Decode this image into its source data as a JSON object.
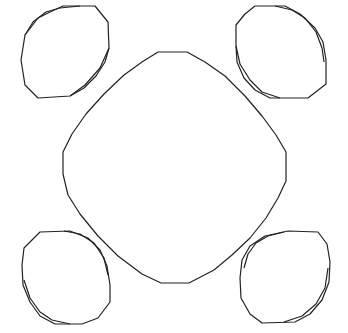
{
  "diagram": {
    "width": 348,
    "height": 333,
    "background": "#ffffff",
    "stroke_color": "#222222",
    "shapes": [
      {
        "id": "center-rounded-square",
        "kind": "closed-polygon",
        "points": [
          [
            158,
            52
          ],
          [
            187,
            52
          ],
          [
            205,
            62
          ],
          [
            225,
            76
          ],
          [
            245,
            96
          ],
          [
            262,
            116
          ],
          [
            276,
            135
          ],
          [
            286,
            152
          ],
          [
            286,
            181
          ],
          [
            278,
            198
          ],
          [
            266,
            218
          ],
          [
            250,
            238
          ],
          [
            232,
            255
          ],
          [
            214,
            270
          ],
          [
            189,
            283
          ],
          [
            161,
            283
          ],
          [
            142,
            274
          ],
          [
            118,
            256
          ],
          [
            98,
            236
          ],
          [
            80,
            214
          ],
          [
            68,
            195
          ],
          [
            63,
            174
          ],
          [
            63,
            152
          ],
          [
            72,
            134
          ],
          [
            86,
            114
          ],
          [
            104,
            94
          ],
          [
            124,
            75
          ],
          [
            142,
            62
          ]
        ]
      },
      {
        "id": "ellipse-top-left-outer",
        "kind": "closed-polygon",
        "points": [
          [
            63,
            6
          ],
          [
            95,
            6
          ],
          [
            108,
            22
          ],
          [
            109,
            48
          ],
          [
            100,
            68
          ],
          [
            85,
            85
          ],
          [
            70,
            96
          ],
          [
            38,
            98
          ],
          [
            25,
            85
          ],
          [
            21,
            60
          ],
          [
            25,
            35
          ],
          [
            38,
            18
          ],
          [
            50,
            12
          ]
        ]
      },
      {
        "id": "ellipse-top-left-inner",
        "kind": "open-polyline",
        "points": [
          [
            25,
            35
          ],
          [
            33,
            22
          ],
          [
            46,
            12
          ],
          [
            60,
            8
          ],
          [
            80,
            6
          ]
        ]
      },
      {
        "id": "ellipse-top-left-inner-2",
        "kind": "open-polyline",
        "points": [
          [
            109,
            48
          ],
          [
            105,
            62
          ],
          [
            96,
            76
          ],
          [
            84,
            88
          ],
          [
            70,
            96
          ]
        ]
      },
      {
        "id": "ellipse-top-right-outer",
        "kind": "closed-polygon",
        "points": [
          [
            255,
            6
          ],
          [
            285,
            6
          ],
          [
            300,
            14
          ],
          [
            315,
            28
          ],
          [
            323,
            42
          ],
          [
            326,
            60
          ],
          [
            326,
            84
          ],
          [
            308,
            98
          ],
          [
            270,
            98
          ],
          [
            255,
            90
          ],
          [
            244,
            78
          ],
          [
            237,
            62
          ],
          [
            236,
            46
          ],
          [
            236,
            25
          ],
          [
            245,
            14
          ]
        ]
      },
      {
        "id": "ellipse-top-right-inner",
        "kind": "open-polyline",
        "points": [
          [
            275,
            6
          ],
          [
            292,
            10
          ],
          [
            305,
            18
          ],
          [
            316,
            32
          ],
          [
            322,
            48
          ],
          [
            324,
            62
          ]
        ]
      },
      {
        "id": "ellipse-top-right-inner-2",
        "kind": "open-polyline",
        "points": [
          [
            236,
            46
          ],
          [
            240,
            64
          ],
          [
            250,
            80
          ],
          [
            262,
            92
          ],
          [
            280,
            98
          ]
        ]
      },
      {
        "id": "ellipse-bottom-left-outer",
        "kind": "closed-polygon",
        "points": [
          [
            40,
            232
          ],
          [
            70,
            231
          ],
          [
            88,
            238
          ],
          [
            100,
            250
          ],
          [
            107,
            266
          ],
          [
            110,
            285
          ],
          [
            110,
            302
          ],
          [
            98,
            318
          ],
          [
            82,
            324
          ],
          [
            55,
            324
          ],
          [
            40,
            316
          ],
          [
            30,
            302
          ],
          [
            23,
            285
          ],
          [
            22,
            265
          ],
          [
            24,
            248
          ]
        ]
      },
      {
        "id": "ellipse-bottom-left-inner",
        "kind": "open-polyline",
        "points": [
          [
            64,
            231
          ],
          [
            80,
            234
          ],
          [
            94,
            243
          ],
          [
            104,
            258
          ],
          [
            108,
            275
          ]
        ]
      },
      {
        "id": "ellipse-bottom-left-inner-2",
        "kind": "open-polyline",
        "points": [
          [
            24,
            280
          ],
          [
            30,
            298
          ],
          [
            40,
            312
          ],
          [
            52,
            320
          ],
          [
            70,
            324
          ]
        ]
      },
      {
        "id": "ellipse-bottom-right-outer",
        "kind": "closed-polygon",
        "points": [
          [
            288,
            231
          ],
          [
            318,
            232
          ],
          [
            327,
            244
          ],
          [
            330,
            262
          ],
          [
            329,
            282
          ],
          [
            322,
            300
          ],
          [
            310,
            314
          ],
          [
            295,
            322
          ],
          [
            262,
            323
          ],
          [
            250,
            314
          ],
          [
            241,
            298
          ],
          [
            240,
            278
          ],
          [
            242,
            260
          ],
          [
            250,
            246
          ],
          [
            265,
            236
          ]
        ]
      },
      {
        "id": "ellipse-bottom-right-inner",
        "kind": "open-polyline",
        "points": [
          [
            244,
            268
          ],
          [
            248,
            254
          ],
          [
            256,
            243
          ],
          [
            268,
            236
          ],
          [
            284,
            232
          ]
        ]
      },
      {
        "id": "ellipse-bottom-right-inner-2",
        "kind": "open-polyline",
        "points": [
          [
            328,
            268
          ],
          [
            325,
            288
          ],
          [
            316,
            304
          ],
          [
            302,
            316
          ],
          [
            284,
            322
          ]
        ]
      }
    ]
  }
}
